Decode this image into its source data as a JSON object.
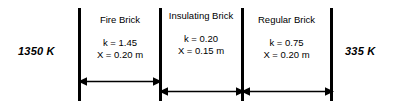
{
  "diagram": {
    "boundary_temperatures": {
      "left": "1350 K",
      "right": "335 K"
    },
    "layers": [
      {
        "name": "Fire Brick",
        "conductivity": "k = 1.45",
        "thickness": "X = 0.20 m",
        "k_value": 1.45,
        "x_value": 0.2
      },
      {
        "name": "Insulating Brick",
        "conductivity": "k = 0.20",
        "thickness": "X = 0.15 m",
        "k_value": 0.2,
        "x_value": 0.15
      },
      {
        "name": "Regular Brick",
        "conductivity": "k = 0.75",
        "thickness": "X = 0.20 m",
        "k_value": 0.75,
        "x_value": 0.2
      }
    ],
    "style": {
      "line_color": "#000000",
      "background": "#ffffff",
      "text_color": "#000000"
    }
  }
}
